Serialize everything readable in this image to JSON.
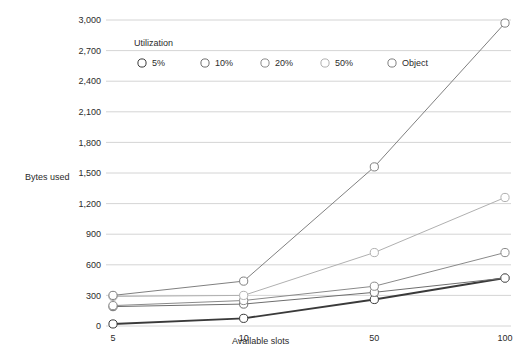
{
  "chart_data": {
    "type": "line",
    "title": "",
    "xlabel": "Available slots",
    "ylabel": "Bytes used",
    "categories": [
      "5",
      "10",
      "50",
      "100"
    ],
    "ylim": [
      0,
      3000
    ],
    "yticks": [
      0,
      300,
      600,
      900,
      1200,
      1500,
      1800,
      2100,
      2400,
      2700,
      3000
    ],
    "ytick_labels": [
      "0",
      "300",
      "600",
      "900",
      "1,200",
      "1,500",
      "1,800",
      "2,100",
      "2,400",
      "2,700",
      "3,000"
    ],
    "grid": true,
    "legend_title": "Utilization",
    "legend_position": "top-left-inside",
    "series": [
      {
        "name": "5%",
        "values": [
          20,
          75,
          260,
          470
        ],
        "color": "#3a3a3a"
      },
      {
        "name": "10%",
        "values": [
          190,
          215,
          330,
          470
        ],
        "color": "#6e6e6e"
      },
      {
        "name": "20%",
        "values": [
          200,
          250,
          390,
          720
        ],
        "color": "#8a8a8a"
      },
      {
        "name": "50%",
        "values": [
          290,
          300,
          720,
          1260
        ],
        "color": "#b0b0b0"
      },
      {
        "name": "Object",
        "values": [
          300,
          440,
          1560,
          2970
        ],
        "color": "#808080"
      }
    ]
  },
  "colors": {
    "gridline": "#c9c9c9",
    "text": "#2b2b2b",
    "background": "#ffffff"
  }
}
